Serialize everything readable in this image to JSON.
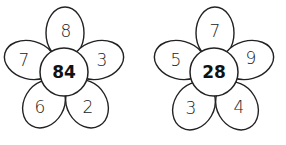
{
  "flowers": [
    {
      "center": "84",
      "petals": {
        "top": "8",
        "left": "7",
        "right": "3",
        "bottom_left": "6",
        "bottom_right": "2"
      }
    },
    {
      "center": "28",
      "petals": {
        "top": "7",
        "left": "5",
        "right": "9",
        "bottom_left": "3",
        "bottom_right": "4"
      }
    }
  ]
}
